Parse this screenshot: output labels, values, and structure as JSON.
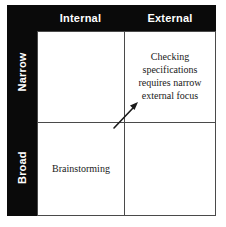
{
  "diagram": {
    "type": "2x2-matrix",
    "columns": [
      {
        "key": "internal",
        "label": "Internal"
      },
      {
        "key": "external",
        "label": "External"
      }
    ],
    "rows": [
      {
        "key": "narrow",
        "label": "Narrow"
      },
      {
        "key": "broad",
        "label": "Broad"
      }
    ],
    "cells": {
      "narrow_internal": "",
      "narrow_external": "Checking specifications requires narrow external focus",
      "broad_internal": "Brainstorming",
      "broad_external": ""
    },
    "annotation": {
      "name": "focus-direction-arrow",
      "description": "arrow pointing from center toward narrow-external quadrant"
    },
    "colors": {
      "header_background": "#0a0a0a",
      "header_text": "#ffffff",
      "grid_line": "#4a4a4a",
      "cell_background": "#ffffff",
      "cell_text": "#1a1a1a",
      "arrow": "#1a1a1a"
    }
  }
}
